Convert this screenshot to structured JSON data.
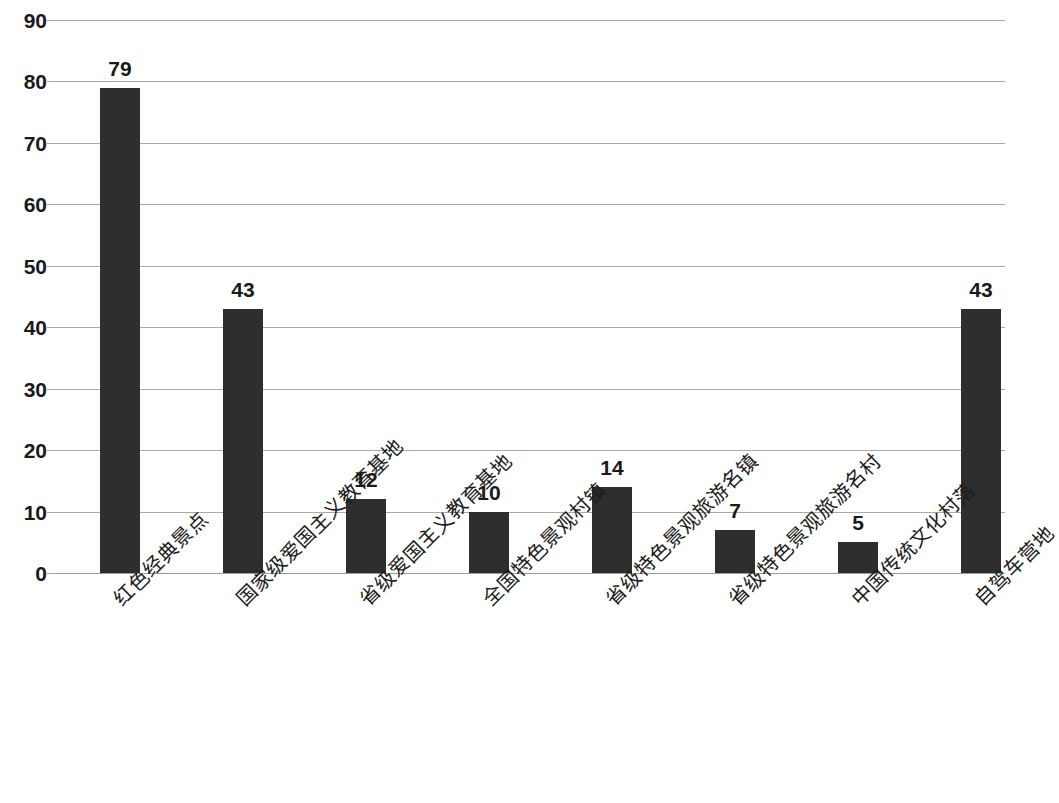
{
  "chart_data": {
    "type": "bar",
    "title": "",
    "subtitle": "",
    "xlabel": "",
    "ylabel": "",
    "ylim": [
      0,
      90
    ],
    "ytick_step": 10,
    "yticks": [
      "90",
      "80",
      "70",
      "60",
      "50",
      "40",
      "30",
      "20",
      "10",
      "0"
    ],
    "grid": true,
    "legend": "none",
    "bar_color": "#2e2e2e",
    "gridline_color": "#a9a9a9",
    "label_rotation_deg": -45,
    "categories": [
      "红色经典景点",
      "国家级爱国主义教育基地",
      "省级爱国主义教育基地",
      "全国特色景观村镇",
      "省级特色景观旅游名镇",
      "省级特色景观旅游名村",
      "中国传统文化村落",
      "自驾车营地"
    ],
    "values": [
      79,
      43,
      12,
      10,
      14,
      7,
      5,
      43
    ],
    "value_labels": [
      "79",
      "43",
      "12",
      "10",
      "14",
      "7",
      "5",
      "43"
    ]
  }
}
